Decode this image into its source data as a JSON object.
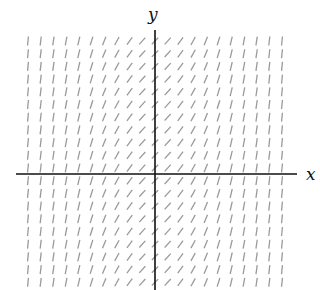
{
  "diagram": {
    "type": "slope_field",
    "axes": {
      "x_label": "x",
      "y_label": "y",
      "origin_px": [
        155,
        174
      ],
      "x_axis_px": {
        "x1": 16,
        "x2": 297
      },
      "y_axis_px": {
        "y1": 30,
        "y2": 290
      }
    },
    "grid": {
      "columns_offset_from_axis": [
        -10,
        -9,
        -8,
        -7,
        -6,
        -5,
        -4,
        -3,
        -2,
        -1,
        0,
        1,
        2,
        3,
        4,
        5,
        6,
        7,
        8,
        9,
        10
      ],
      "column_spacing_px": 12.7,
      "row_start_px": 41,
      "row_count": 20,
      "row_spacing_px": 12.7,
      "x_units_per_column": 0.3,
      "slope_rule": "1 + x^2",
      "segment_length_px": 9,
      "segment_color": "#9a9a9a"
    },
    "colors": {
      "axis": "#111111",
      "segment": "#9a9a9a",
      "background": "#ffffff"
    }
  }
}
